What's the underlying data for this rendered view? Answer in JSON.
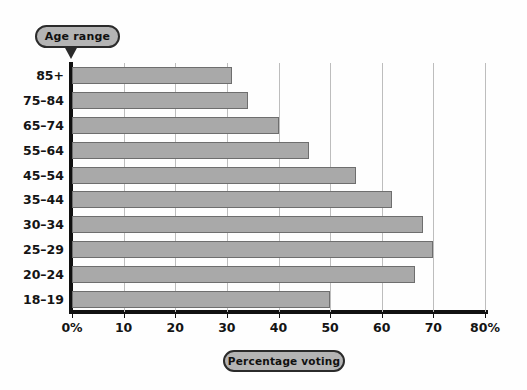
{
  "chart_data": {
    "type": "bar",
    "orientation": "horizontal",
    "title": "",
    "xlabel": "Percentage voting",
    "ylabel": "Age range",
    "categories": [
      "85+",
      "75–84",
      "65–74",
      "55–64",
      "45–54",
      "35–44",
      "30–34",
      "25–29",
      "20–24",
      "18–19"
    ],
    "values": [
      31,
      34,
      40,
      46,
      55,
      62,
      68,
      70,
      66.5,
      50
    ],
    "xlim": [
      0,
      80
    ],
    "xticks": [
      0,
      10,
      20,
      30,
      40,
      50,
      60,
      70,
      80
    ],
    "xtick_labels": [
      "0%",
      "10",
      "20",
      "30",
      "40",
      "50",
      "60",
      "70",
      "80%"
    ],
    "grid": "vertical",
    "legend": "none",
    "bar_color": "#a9a9a9",
    "bar_edge_color": "#6e6e6e",
    "gridline_color": "#bdbdbd",
    "axis_color": "#111111"
  },
  "labels": {
    "y_axis_title": "Age range",
    "x_axis_title": "Percentage voting"
  }
}
